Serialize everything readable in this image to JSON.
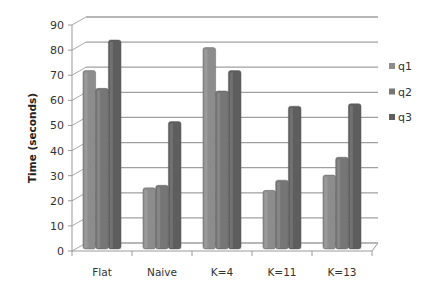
{
  "chart_data": {
    "type": "bar",
    "style": "3d-clustered-column",
    "title": "",
    "xlabel": "",
    "ylabel": "Time (seconds)",
    "ylim": [
      0,
      90
    ],
    "yticks": [
      0,
      10,
      20,
      30,
      40,
      50,
      60,
      70,
      80,
      90
    ],
    "grid": true,
    "legend_position": "right",
    "categories": [
      "Flat",
      "Naive",
      "K=4",
      "K=11",
      "K=13"
    ],
    "series": [
      {
        "name": "q1",
        "color": "#8c8c8c",
        "values": [
          70,
          24,
          79,
          23,
          29
        ]
      },
      {
        "name": "q2",
        "color": "#767676",
        "values": [
          63,
          25,
          62,
          27,
          36
        ]
      },
      {
        "name": "q3",
        "color": "#5e5e5e",
        "values": [
          82,
          50,
          70,
          56,
          57
        ]
      }
    ]
  }
}
